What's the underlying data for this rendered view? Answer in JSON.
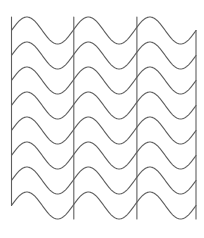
{
  "figure": {
    "canvas": {
      "width": 204,
      "height": 238,
      "background_color": "#ffffff"
    },
    "stroke": {
      "color": "#5f5f5f",
      "width": 1.1
    },
    "geometry": {
      "left_x": 11.5,
      "right_x": 196.0,
      "interior_vertical_x": [
        73.8,
        136.9
      ],
      "row_count": 8,
      "row_baseline_y": [
        30.5,
        55.5,
        80.5,
        105.5,
        130.5,
        155.5,
        180.5,
        205.5
      ],
      "row_spacing": 25,
      "wave_amplitude": 13.5,
      "wave_period": 61.5,
      "periods_per_row": 3,
      "wave_phase": "crest-first",
      "connector_left_x": 11.5,
      "connector_right_x": 196.0,
      "connector_top_y": 17.0,
      "connector_bottom_y": 219.0,
      "interior_vertical_top_y": 17.0,
      "interior_vertical_bottom_y": 219.0
    },
    "rows": [
      {
        "index": 0,
        "baseline_y": 30.5,
        "direction": "right"
      },
      {
        "index": 1,
        "baseline_y": 55.5,
        "direction": "left"
      },
      {
        "index": 2,
        "baseline_y": 80.5,
        "direction": "right"
      },
      {
        "index": 3,
        "baseline_y": 105.5,
        "direction": "left"
      },
      {
        "index": 4,
        "baseline_y": 130.5,
        "direction": "right"
      },
      {
        "index": 5,
        "baseline_y": 155.5,
        "direction": "left"
      },
      {
        "index": 6,
        "baseline_y": 180.5,
        "direction": "right"
      },
      {
        "index": 7,
        "baseline_y": 205.5,
        "direction": "left"
      }
    ],
    "vertical_connectors": [
      {
        "index": 0,
        "x": 11.5,
        "y_top": 17.0,
        "y_bottom": 205.5,
        "side": "left"
      },
      {
        "index": 1,
        "x": 73.8,
        "y_top": 17.0,
        "y_bottom": 219.0,
        "side": "interior"
      },
      {
        "index": 2,
        "x": 136.9,
        "y_top": 17.0,
        "y_bottom": 219.0,
        "side": "interior"
      },
      {
        "index": 3,
        "x": 196.0,
        "y_top": 30.5,
        "y_bottom": 219.0,
        "side": "right"
      }
    ]
  }
}
